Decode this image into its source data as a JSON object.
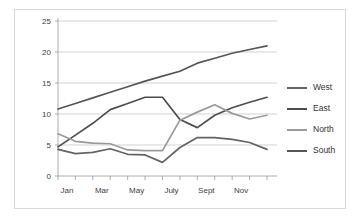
{
  "chart_data": {
    "type": "line",
    "title": "",
    "xlabel": "",
    "ylabel": "",
    "ylim": [
      0,
      25
    ],
    "yticks": [
      0,
      5,
      10,
      15,
      20,
      25
    ],
    "ytick_labels": [
      "0",
      "5",
      "10",
      "15",
      "20",
      "25"
    ],
    "grid": true,
    "legend_position": "right",
    "x": [
      "Jan",
      "Feb",
      "Mar",
      "Apr",
      "May",
      "June",
      "July",
      "Aug",
      "Sept",
      "Oct",
      "Nov",
      "Dec",
      "Jan"
    ],
    "xtick_labels": [
      "Jan",
      "Mar",
      "May",
      "July",
      "Sept",
      "Nov"
    ],
    "xtick_indices": [
      0,
      2,
      4,
      6,
      8,
      10
    ],
    "series": [
      {
        "name": "West",
        "color": "#636363",
        "values": [
          4.3,
          3.6,
          3.8,
          4.4,
          3.5,
          3.4,
          2.2,
          4.6,
          6.2,
          6.2,
          5.9,
          5.4,
          4.3
        ]
      },
      {
        "name": "East",
        "color": "#4d4d4d",
        "values": [
          4.7,
          6.6,
          8.5,
          10.7,
          11.7,
          12.7,
          12.7,
          9.1,
          7.8,
          9.8,
          11.0,
          11.9,
          12.7
        ]
      },
      {
        "name": "North",
        "color": "#9a9a9a",
        "values": [
          6.8,
          5.6,
          5.3,
          5.2,
          4.2,
          4.1,
          4.1,
          9.0,
          10.3,
          11.5,
          10.1,
          9.2,
          9.8
        ]
      },
      {
        "name": "South",
        "color": "#555555",
        "values": [
          10.8,
          11.7,
          12.6,
          13.5,
          14.4,
          15.3,
          16.1,
          16.9,
          18.2,
          19.0,
          19.8,
          20.4,
          21.0
        ]
      }
    ]
  },
  "legend": {
    "items": [
      {
        "label": "West"
      },
      {
        "label": "East"
      },
      {
        "label": "North"
      },
      {
        "label": "South"
      }
    ]
  }
}
